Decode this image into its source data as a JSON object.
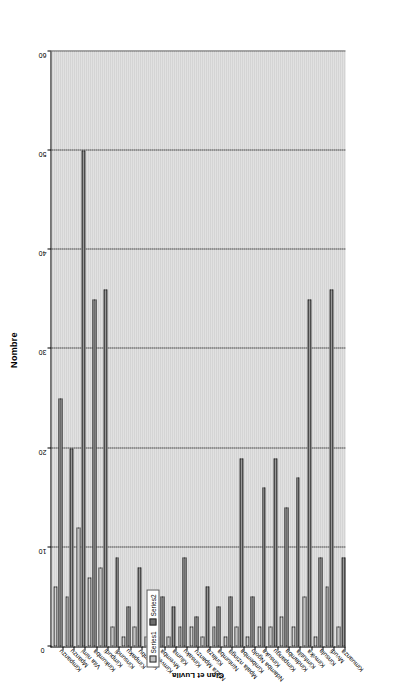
{
  "chart_data": {
    "type": "bar",
    "orientation": "horizontal",
    "title": "Nombre",
    "xlabel": "Nombre",
    "ylabel": "Clan et Luvila",
    "xlim": [
      0,
      60
    ],
    "xticks": [
      0,
      10,
      20,
      30,
      40,
      50,
      60
    ],
    "grid": true,
    "legend_position": "left-outside",
    "categories": [
      "Kimpanzu",
      "Mpanzu",
      "Vita nimi",
      "Kinkumba",
      "Kimpudi",
      "Kinsundi",
      "Kimpaku",
      "Kibumbu",
      "Kimvemba",
      "Mvemba",
      "Kiluma",
      "Kinsaku",
      "Nlaza Mpanzu",
      "Kinlaza",
      "Nintumba",
      "Mpala nzinga",
      "Kimbemba",
      "Ndamba Ngolo",
      "Kinsuka",
      "Kimpangu",
      "Kindamba",
      "Kimfutila",
      "Kimvika",
      "Kinsula",
      "Mvudi",
      "Kimuanza"
    ],
    "series": [
      {
        "name": "Series1",
        "values": [
          6,
          5,
          12,
          7,
          8,
          2,
          1,
          2,
          1,
          1,
          1,
          2,
          2,
          1,
          2,
          1,
          2,
          1,
          2,
          2,
          3,
          2,
          5,
          1,
          6,
          2
        ]
      },
      {
        "name": "Series2",
        "values": [
          25,
          20,
          50,
          35,
          36,
          9,
          4,
          8,
          2,
          5,
          4,
          9,
          3,
          6,
          4,
          5,
          19,
          5,
          16,
          19,
          14,
          17,
          35,
          9,
          36,
          9
        ]
      }
    ]
  },
  "legend": {
    "items": [
      {
        "label": "Series1",
        "color": "#c2c2c2"
      },
      {
        "label": "Series2",
        "color": "#6d6d6d"
      }
    ]
  },
  "axis": {
    "value_axis_title": "Nombre",
    "category_axis_title": "Clan et Luvila"
  }
}
